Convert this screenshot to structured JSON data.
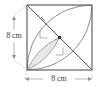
{
  "figure": {
    "kind": "geometry-diagram",
    "shape": "square",
    "side_length_label": "8 cm",
    "side_length_value": 8,
    "units": "cm",
    "labels": {
      "left_side": "8 cm",
      "bottom_side": "8 cm"
    },
    "arcs": {
      "count": 2,
      "radius_label": "8 cm",
      "radius_value": 8,
      "centers": [
        "top-left-corner",
        "bottom-right-corner"
      ],
      "type": "quarter-circle"
    },
    "markers": {
      "radius_ticks": 2,
      "right_angle_marks": 2,
      "center_dot": true
    },
    "shaded_region": {
      "name": "lens",
      "fill": "#e8e8e8",
      "hatched": true
    },
    "colors": {
      "outline": "#4a4a4a",
      "square_border": "#555555",
      "arc": "#6b6b6b",
      "diagonal": "#5a5a5a",
      "shade_fill": "#ebebeb",
      "hatch": "#bdbdbd",
      "dimension_line": "#9a9a9a",
      "text": "#3a3a3a",
      "background": "#ffffff"
    }
  }
}
